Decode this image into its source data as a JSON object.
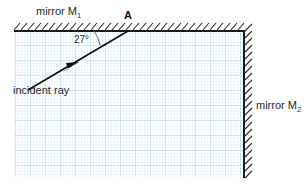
{
  "figure": {
    "type": "optics-ray-diagram",
    "title": "",
    "background_color": "#ffffff",
    "grid": {
      "minor_color": "#cfe6f2",
      "major_color": "#a9d3e8",
      "minor_step": 3,
      "major_step": 15,
      "x0": 14,
      "y0": 31,
      "x1": 244,
      "y1": 178
    },
    "mirrors": [
      {
        "id": "M1",
        "label": "mirror M",
        "subscript": "1",
        "orientation": "horizontal",
        "line_color": "#1a1a1a",
        "hatch_color": "#2b2b2b",
        "hatch_side": "above",
        "x_start": 14,
        "x_end": 244,
        "y": 31
      },
      {
        "id": "M2",
        "label": "mirror M",
        "subscript": "2",
        "orientation": "vertical",
        "line_color": "#1a1a1a",
        "hatch_color": "#2b2b2b",
        "hatch_side": "right",
        "x": 244,
        "y_start": 31,
        "y_end": 178
      }
    ],
    "rays": [
      {
        "id": "incident",
        "label": "incident ray",
        "color": "#111111",
        "from_x": 28,
        "from_y": 90,
        "to_x": 128,
        "to_y": 31,
        "arrow_at_x": 70,
        "arrow_at_y": 66,
        "arrow_direction": "up-right"
      }
    ],
    "points": [
      {
        "id": "A",
        "label": "A",
        "x": 128,
        "y": 31,
        "description": "point of incidence on mirror M1"
      }
    ],
    "angles": [
      {
        "id": "angle-of-incidence-from-surface",
        "value": 27,
        "unit": "degrees",
        "label": "27°",
        "between": "incident ray and mirror M1 surface",
        "vertex_x": 128,
        "vertex_y": 31,
        "arc_color": "#555555"
      }
    ]
  }
}
